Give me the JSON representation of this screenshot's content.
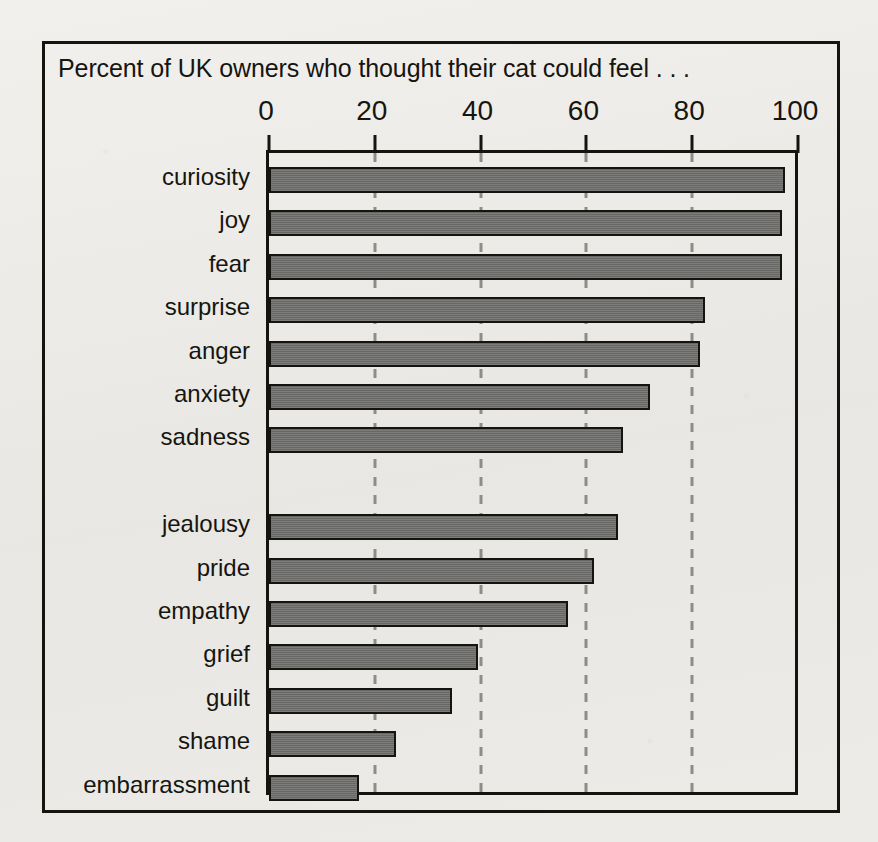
{
  "figure": {
    "title": "Percent of UK owners who thought their cat could feel . . .",
    "frame_color": "#15140f",
    "background_color": "#eceae6",
    "bar_color": "#6d6d6b",
    "gridline_color": "#8d8d88"
  },
  "chart_data": {
    "type": "bar",
    "orientation": "horizontal",
    "title": "Percent of UK owners who thought their cat could feel . . .",
    "xlabel": "",
    "ylabel": "",
    "xlim": [
      0,
      100
    ],
    "xticks": [
      0,
      20,
      40,
      60,
      80,
      100
    ],
    "tick_labels": [
      "0",
      "20",
      "40",
      "60",
      "80",
      "100"
    ],
    "grid": "vertical dashed gridlines at each tick",
    "axis_position": "top",
    "legend": "none",
    "categories": [
      "curiosity",
      "joy",
      "fear",
      "surprise",
      "anger",
      "anxiety",
      "sadness",
      "jealousy",
      "pride",
      "empathy",
      "grief",
      "guilt",
      "shame",
      "embarrassment"
    ],
    "values": [
      97.5,
      97,
      97,
      82.5,
      81.5,
      72,
      67,
      66,
      61.5,
      56.5,
      39.5,
      34.5,
      24,
      17
    ],
    "group_break_after_index": 6,
    "groups": [
      {
        "name": "basic emotions",
        "items": [
          "curiosity",
          "joy",
          "fear",
          "surprise",
          "anger",
          "anxiety",
          "sadness"
        ]
      },
      {
        "name": "complex emotions",
        "items": [
          "jealousy",
          "pride",
          "empathy",
          "grief",
          "guilt",
          "shame",
          "embarrassment"
        ]
      }
    ]
  }
}
